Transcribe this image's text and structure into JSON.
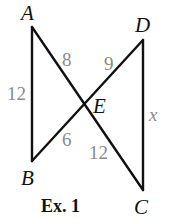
{
  "figure": {
    "caption": "Ex. 1",
    "colors": {
      "lines": "#111111",
      "point_labels": "#111111",
      "measure_labels": "#8a8a8a"
    },
    "points": {
      "A": {
        "label": "A",
        "x": 32,
        "y": 27
      },
      "B": {
        "label": "B",
        "x": 32,
        "y": 161
      },
      "C": {
        "label": "C",
        "x": 143,
        "y": 190
      },
      "D": {
        "label": "D",
        "x": 143,
        "y": 40
      },
      "E": {
        "label": "E",
        "x": 84,
        "y": 105
      }
    },
    "segments": [
      {
        "from": "A",
        "to": "B",
        "label": "12"
      },
      {
        "from": "A",
        "to": "E",
        "label": "8"
      },
      {
        "from": "E",
        "to": "C",
        "label": "12"
      },
      {
        "from": "D",
        "to": "E",
        "label": "9"
      },
      {
        "from": "E",
        "to": "B",
        "label": "6"
      },
      {
        "from": "D",
        "to": "C",
        "label": "x"
      }
    ],
    "measure_labels": {
      "AB": "12",
      "AE": "8",
      "DE": "9",
      "EB": "6",
      "EC": "12",
      "DC": "x"
    }
  }
}
